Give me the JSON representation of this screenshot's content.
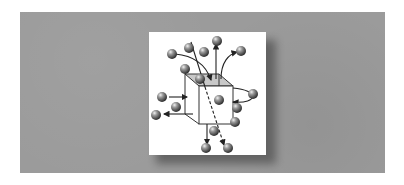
{
  "figure": {
    "colors": {
      "panel": "#9b9b9b",
      "card": "#ffffff",
      "cube_top": "#c8c8c8",
      "sphere": "#6a6a6a",
      "line": "#222222"
    },
    "elements": {
      "cube": "cube-volume",
      "spheres_count": 19,
      "arrows": [
        "curved-arrow-into-top-left",
        "straight-arrow-up-from-top",
        "curved-arrow-up-right-from-top",
        "arrow-into-left-face",
        "arrow-out-left-face",
        "loop-arrow-right-face",
        "arrow-down-from-bottom",
        "dashed-diagonal-arrow-through-cube"
      ]
    }
  }
}
